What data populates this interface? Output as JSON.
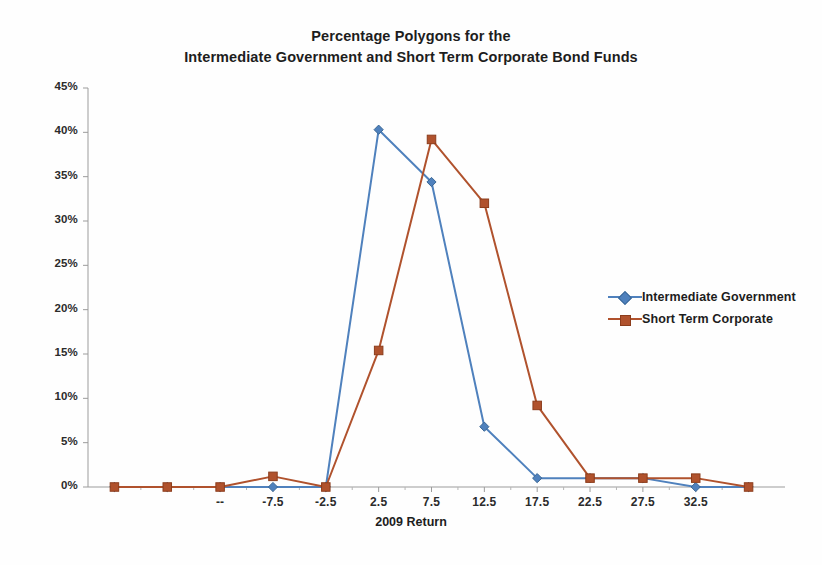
{
  "chart_data": {
    "type": "line",
    "title": "Percentage Polygons for the Intermediate Government and Short Term Corporate Bond Funds",
    "title_line1": "Percentage Polygons for the",
    "title_line2": "Intermediate Government and Short Term Corporate Bond Funds",
    "xlabel": "2009 Return",
    "ylabel": "",
    "x": [
      -22.5,
      -17.5,
      -12.5,
      -7.5,
      -2.5,
      2.5,
      7.5,
      12.5,
      17.5,
      22.5,
      27.5,
      32.5,
      37.5
    ],
    "xticks": [
      "",
      "",
      "--",
      "-7.5",
      "-2.5",
      "2.5",
      "7.5",
      "12.5",
      "17.5",
      "22.5",
      "27.5",
      "32.5",
      ""
    ],
    "xtick_labels_visible": [
      "--",
      "-7.5",
      "-2.5",
      "2.5",
      "7.5",
      "12.5",
      "17.5",
      "22.5",
      "27.5",
      "32.5"
    ],
    "yticks": [
      "0%",
      "5%",
      "10%",
      "15%",
      "20%",
      "25%",
      "30%",
      "35%",
      "40%",
      "45%"
    ],
    "ytick_values": [
      0,
      5,
      10,
      15,
      20,
      25,
      30,
      35,
      40,
      45
    ],
    "ylim": [
      0,
      45
    ],
    "xlim": [
      -25,
      40
    ],
    "grid": false,
    "legend_position": "right-center",
    "series": [
      {
        "name": "Intermediate Government",
        "color": "#4F81BD",
        "marker": "diamond",
        "x": [
          -22.5,
          -17.5,
          -12.5,
          -7.5,
          -2.5,
          2.5,
          7.5,
          12.5,
          17.5,
          22.5,
          27.5,
          32.5,
          37.5
        ],
        "values": [
          0,
          0,
          0,
          0,
          0,
          40.3,
          34.4,
          6.8,
          1.0,
          1.0,
          1.0,
          0,
          0
        ]
      },
      {
        "name": "Short Term Corporate",
        "color": "#B0522D",
        "marker": "square",
        "x": [
          -22.5,
          -17.5,
          -12.5,
          -7.5,
          -2.5,
          2.5,
          7.5,
          12.5,
          17.5,
          22.5,
          27.5,
          32.5,
          37.5
        ],
        "values": [
          0,
          0,
          0,
          1.2,
          0,
          15.4,
          39.2,
          32.0,
          9.2,
          1.0,
          1.0,
          1.0,
          0
        ]
      }
    ]
  },
  "legend": {
    "items": [
      {
        "label": "Intermediate Government",
        "color": "#4F81BD",
        "marker": "diamond"
      },
      {
        "label": "Short Term Corporate",
        "color": "#B0522D",
        "marker": "square"
      }
    ]
  },
  "axis": {
    "x_title": "2009 Return"
  }
}
